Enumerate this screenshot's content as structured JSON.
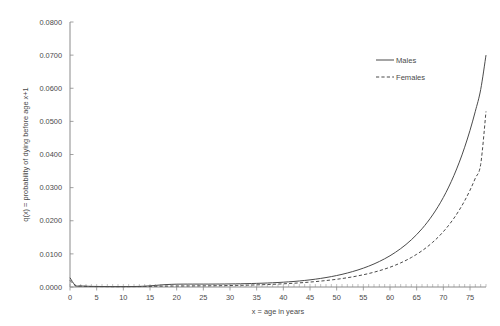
{
  "chart_data": {
    "type": "line",
    "title": "",
    "subtitle": "",
    "xlabel": "x = age in years",
    "ylabel": "q(x) = probability of dying before age x+1",
    "xlim": [
      0,
      78
    ],
    "ylim": [
      0.0,
      0.08
    ],
    "grid": false,
    "legend_position": "top-right",
    "x_ticks": [
      0,
      5,
      10,
      15,
      20,
      25,
      30,
      35,
      40,
      45,
      50,
      55,
      60,
      65,
      70,
      75
    ],
    "x_tick_labels": [
      "0",
      "5",
      "10",
      "15",
      "20",
      "25",
      "30",
      "35",
      "40",
      "45",
      "50",
      "55",
      "60",
      "65",
      "70",
      "75"
    ],
    "x_minor_tick_step": 1,
    "y_ticks": [
      0.0,
      0.01,
      0.02,
      0.03,
      0.04,
      0.05,
      0.06,
      0.07,
      0.08
    ],
    "y_tick_labels": [
      "0.0000",
      "0.0100",
      "0.0200",
      "0.0300",
      "0.0400",
      "0.0500",
      "0.0600",
      "0.0700",
      "0.0800"
    ],
    "x": [
      0,
      1,
      2,
      3,
      4,
      5,
      6,
      7,
      8,
      9,
      10,
      11,
      12,
      13,
      14,
      15,
      16,
      17,
      18,
      19,
      20,
      21,
      22,
      23,
      24,
      25,
      26,
      27,
      28,
      29,
      30,
      31,
      32,
      33,
      34,
      35,
      36,
      37,
      38,
      39,
      40,
      41,
      42,
      43,
      44,
      45,
      46,
      47,
      48,
      49,
      50,
      51,
      52,
      53,
      54,
      55,
      56,
      57,
      58,
      59,
      60,
      61,
      62,
      63,
      64,
      65,
      66,
      67,
      68,
      69,
      70,
      71,
      72,
      73,
      74,
      75,
      76,
      77,
      78
    ],
    "series": [
      {
        "name": "Males",
        "style": "solid",
        "color": "#4b4b4b",
        "values": [
          0.0028,
          0.00048,
          0.00032,
          0.00024,
          0.00019,
          0.00017,
          0.00015,
          0.00014,
          0.00013,
          0.00013,
          0.00013,
          0.00014,
          0.00015,
          0.00018,
          0.00025,
          0.00035,
          0.00048,
          0.00062,
          0.00073,
          0.0008,
          0.00085,
          0.00087,
          0.00088,
          0.00088,
          0.00088,
          0.00088,
          0.00088,
          0.00089,
          0.0009,
          0.00091,
          0.00093,
          0.00095,
          0.00098,
          0.00101,
          0.00105,
          0.0011,
          0.00115,
          0.00121,
          0.00128,
          0.00136,
          0.00145,
          0.00156,
          0.00168,
          0.00182,
          0.00198,
          0.00216,
          0.00236,
          0.00259,
          0.00285,
          0.00314,
          0.00346,
          0.00382,
          0.00422,
          0.00466,
          0.00515,
          0.00569,
          0.00629,
          0.00696,
          0.0077,
          0.00852,
          0.00943,
          0.01045,
          0.01158,
          0.01284,
          0.01425,
          0.01582,
          0.01758,
          0.01955,
          0.02176,
          0.02424,
          0.02703,
          0.03017,
          0.03371,
          0.0377,
          0.0422,
          0.04729,
          0.05305,
          0.05957,
          0.07
        ]
      },
      {
        "name": "Females",
        "style": "dashed",
        "color": "#4b4b4b",
        "values": [
          0.002,
          0.0004,
          0.00026,
          0.00019,
          0.00015,
          0.00013,
          0.00012,
          0.00011,
          0.0001,
          0.0001,
          0.0001,
          0.00011,
          0.00012,
          0.00013,
          0.00016,
          0.00019,
          0.00022,
          0.00025,
          0.00027,
          0.00029,
          0.0003,
          0.00031,
          0.00032,
          0.00033,
          0.00034,
          0.00035,
          0.00036,
          0.00038,
          0.0004,
          0.00042,
          0.00045,
          0.00048,
          0.00051,
          0.00055,
          0.00059,
          0.00064,
          0.00069,
          0.00075,
          0.00081,
          0.00088,
          0.00096,
          0.00105,
          0.00114,
          0.00125,
          0.00136,
          0.00149,
          0.00163,
          0.00178,
          0.00195,
          0.00213,
          0.00233,
          0.00255,
          0.0028,
          0.00307,
          0.00337,
          0.0037,
          0.00406,
          0.00447,
          0.00492,
          0.00542,
          0.00597,
          0.00659,
          0.00728,
          0.00805,
          0.00891,
          0.00987,
          0.01094,
          0.01214,
          0.01349,
          0.015,
          0.0167,
          0.01862,
          0.02079,
          0.02325,
          0.02604,
          0.02922,
          0.03286,
          0.037,
          0.053
        ]
      }
    ]
  },
  "legend": {
    "entries": [
      {
        "label": "Males",
        "style": "solid"
      },
      {
        "label": "Females",
        "style": "dashed"
      }
    ]
  },
  "axes": {
    "x_title": "x = age in years",
    "y_title": "q(x) = probability of dying before age x+1"
  }
}
